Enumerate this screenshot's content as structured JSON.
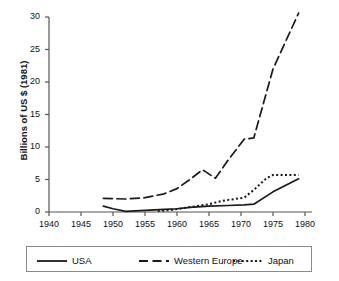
{
  "chart_data": {
    "type": "line",
    "title": "",
    "xlabel": "",
    "ylabel": "Billions of US $ (1981)",
    "xlim": [
      1940,
      1980
    ],
    "ylim": [
      0,
      30
    ],
    "xticks": [
      1940,
      1945,
      1950,
      1955,
      1960,
      1965,
      1970,
      1975,
      1980
    ],
    "yticks": [
      0,
      5,
      10,
      15,
      20,
      25,
      30
    ],
    "grid": false,
    "legend_position": "below-plot",
    "series": [
      {
        "name": "USA",
        "style": "solid",
        "color": "#1a1a1a",
        "x": [
          1948.5,
          1950,
          1952,
          1955,
          1958,
          1960,
          1962,
          1965,
          1968,
          1970.5,
          1972,
          1975,
          1979
        ],
        "values": [
          0.9,
          0.5,
          0.1,
          0.25,
          0.4,
          0.5,
          0.7,
          0.9,
          1.0,
          1.1,
          1.2,
          3.1,
          5.1
        ]
      },
      {
        "name": "Western Europe",
        "style": "dashed",
        "color": "#1a1a1a",
        "x": [
          1948.5,
          1952,
          1955,
          1958,
          1960,
          1962,
          1964,
          1966,
          1968,
          1970.5,
          1972,
          1975,
          1979
        ],
        "values": [
          2.1,
          2.0,
          2.2,
          2.8,
          3.6,
          5.0,
          6.5,
          5.2,
          8.0,
          11.2,
          11.4,
          22.0,
          30.6
        ]
      },
      {
        "name": "Japan",
        "style": "dotted",
        "color": "#1a1a1a",
        "x": [
          1957,
          1959,
          1961,
          1963,
          1965,
          1967,
          1969,
          1970.5,
          1972,
          1974,
          1975,
          1979
        ],
        "values": [
          0.15,
          0.3,
          0.6,
          0.9,
          1.2,
          1.7,
          2.0,
          2.2,
          3.4,
          5.2,
          5.7,
          5.7
        ]
      }
    ]
  },
  "legend": {
    "items": [
      {
        "label": "USA",
        "style": "solid"
      },
      {
        "label": "Western Europe",
        "style": "dashed"
      },
      {
        "label": "Japan",
        "style": "dotted"
      }
    ]
  }
}
